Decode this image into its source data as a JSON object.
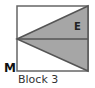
{
  "diagram": {
    "labels": {
      "point_m": "M",
      "region_e": "E"
    },
    "caption": "Block 3",
    "colors": {
      "fill": "#a6a6a6",
      "stroke": "#555555",
      "background": "#ffffff",
      "label": "#222222"
    }
  }
}
